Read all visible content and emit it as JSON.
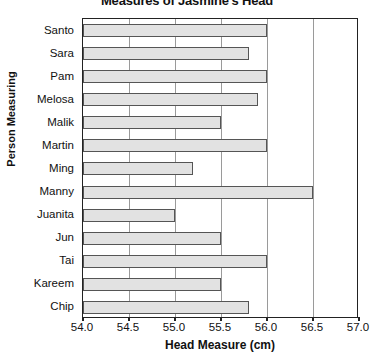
{
  "chart_data": {
    "type": "bar",
    "orientation": "horizontal",
    "title": "Measures of Jasmine's Head",
    "xlabel": "Head Measure (cm)",
    "ylabel": "Person Measuring",
    "xlim": [
      54.0,
      57.0
    ],
    "xticks": [
      "54.0",
      "54.5",
      "55.0",
      "55.5",
      "56.0",
      "56.5",
      "57.0"
    ],
    "xtick_values": [
      54.0,
      54.5,
      55.0,
      55.5,
      56.0,
      56.5,
      57.0
    ],
    "grid": "vertical",
    "legend": "none",
    "bar_fill_color": "#e2e2e2",
    "bar_edge_color": "#555555",
    "categories": [
      "Santo",
      "Sara",
      "Pam",
      "Melosa",
      "Malik",
      "Martin",
      "Ming",
      "Manny",
      "Juanita",
      "Jun",
      "Tai",
      "Kareem",
      "Chip"
    ],
    "values": [
      56.0,
      55.8,
      56.0,
      55.9,
      55.5,
      56.0,
      55.2,
      56.5,
      55.0,
      55.5,
      56.0,
      55.5,
      55.8
    ]
  }
}
